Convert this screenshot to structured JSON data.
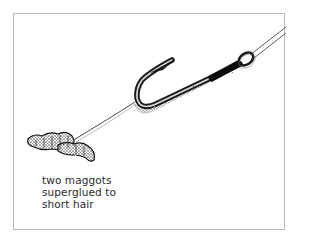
{
  "illustration": {
    "subject": "fishing hook with hair rig and two maggots",
    "caption_lines": [
      "two maggots",
      "superglued to",
      "short hair"
    ],
    "colors": {
      "ink": "#1a1a1a",
      "frame": "#b8b8b8",
      "background": "#ffffff",
      "text": "#2a2a2a"
    }
  }
}
